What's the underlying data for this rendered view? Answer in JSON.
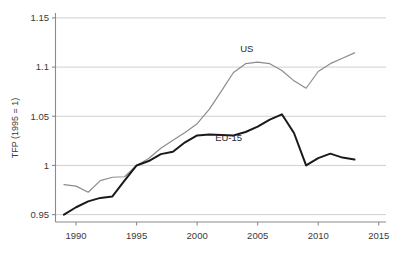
{
  "chart_data": {
    "type": "line",
    "title": "",
    "xlabel": "",
    "ylabel": "TFP (1995 = 1)",
    "xlim": [
      1988.3,
      2015.6
    ],
    "ylim": [
      0.9425,
      1.155
    ],
    "grid": true,
    "grid_axis": "y",
    "legend": "inline-labels",
    "xticks": [
      1990,
      1995,
      2000,
      2005,
      2010,
      2015
    ],
    "xticklabels": [
      "1990",
      "1995",
      "2000",
      "2005",
      "2010",
      "2015"
    ],
    "yticks": [
      0.95,
      1.0,
      1.05,
      1.1,
      1.15
    ],
    "yticklabels": [
      "0.95",
      "1",
      "1.05",
      "1.1",
      "1.15"
    ],
    "x": [
      1989,
      1990,
      1991,
      1992,
      1993,
      1994,
      1995,
      1996,
      1997,
      1998,
      1999,
      2000,
      2001,
      2002,
      2003,
      2004,
      2005,
      2006,
      2007,
      2008,
      2009,
      2010,
      2011,
      2012,
      2013
    ],
    "series": [
      {
        "name": "US",
        "color": "#8c8c8c",
        "width": 1.2,
        "label_x": 2004.1,
        "label_y": 1.1155,
        "values": [
          0.9805,
          0.979,
          0.9728,
          0.9845,
          0.988,
          0.9885,
          1.0,
          1.007,
          1.0175,
          1.0255,
          1.0335,
          1.0425,
          1.057,
          1.0755,
          1.0945,
          1.1035,
          1.105,
          1.1035,
          1.0965,
          1.086,
          1.0785,
          1.0955,
          1.1035,
          1.109,
          1.1145
        ]
      },
      {
        "name": "EU-15",
        "color": "#1a1a1a",
        "width": 2.0,
        "label_x": 2002.6,
        "label_y": 1.0245,
        "values": [
          0.95,
          0.9575,
          0.9635,
          0.967,
          0.9685,
          0.9845,
          1.0,
          1.0045,
          1.0115,
          1.014,
          1.0235,
          1.0305,
          1.0315,
          1.031,
          1.0305,
          1.034,
          1.0395,
          1.0465,
          1.052,
          1.033,
          1.0,
          1.0075,
          1.012,
          1.008,
          1.006
        ]
      }
    ]
  }
}
